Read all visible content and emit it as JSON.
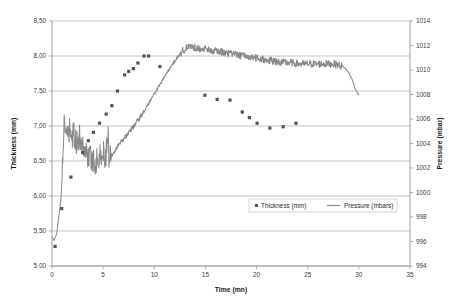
{
  "chart_data": {
    "type": "line",
    "title": "",
    "xlabel": "Time (mn)",
    "ylabel": "Thickness (mm)",
    "y2label": "Pressure (mbar)",
    "xlim": [
      0,
      35
    ],
    "ylim": [
      5.0,
      8.5
    ],
    "y2lim": [
      994,
      1014
    ],
    "grid": true,
    "legend_position": "bottom-center",
    "xticks": [
      "0",
      "5",
      "10",
      "15",
      "20",
      "25",
      "30",
      "35"
    ],
    "xtick_values": [
      0,
      5,
      10,
      15,
      20,
      25,
      30,
      35
    ],
    "yticks": [
      "5,00",
      "5,50",
      "6,00",
      "6,50",
      "7,00",
      "7,50",
      "8,00",
      "8,50"
    ],
    "ytick_values": [
      5.0,
      5.5,
      6.0,
      6.5,
      7.0,
      7.5,
      8.0,
      8.5
    ],
    "y2ticks": [
      "994",
      "996",
      "998",
      "1000",
      "1002",
      "1004",
      "1006",
      "1008",
      "1010",
      "1012",
      "1014"
    ],
    "y2tick_values": [
      994,
      996,
      998,
      1000,
      1002,
      1004,
      1006,
      1008,
      1010,
      1012,
      1014
    ],
    "series": [
      {
        "name": "Thickness (mm)",
        "axis": "left",
        "style": "scatter",
        "marker": "square",
        "color": "#555555",
        "points": [
          [
            0.3,
            5.28
          ],
          [
            0.95,
            5.82
          ],
          [
            1.85,
            6.27
          ],
          [
            3.0,
            6.62
          ],
          [
            3.55,
            6.79
          ],
          [
            4.05,
            6.91
          ],
          [
            4.65,
            7.04
          ],
          [
            5.3,
            7.17
          ],
          [
            5.85,
            7.29
          ],
          [
            6.4,
            7.5
          ],
          [
            7.1,
            7.73
          ],
          [
            7.5,
            7.78
          ],
          [
            7.95,
            7.82
          ],
          [
            8.4,
            7.9
          ],
          [
            9.0,
            8.0
          ],
          [
            9.45,
            8.0
          ],
          [
            10.55,
            7.85
          ],
          [
            14.95,
            7.44
          ],
          [
            16.15,
            7.38
          ],
          [
            17.4,
            7.37
          ],
          [
            20.05,
            7.04
          ],
          [
            21.3,
            6.97
          ],
          [
            22.6,
            6.99
          ],
          [
            23.85,
            7.04
          ],
          [
            18.6,
            7.2
          ],
          [
            19.3,
            7.12
          ]
        ]
      },
      {
        "name": "Pressure (mbars)",
        "axis": "right",
        "style": "line",
        "color": "#8a8a8a",
        "description": "Noisy rise from ~996 mbar to ~1005 mbar before 5 mn, dip to ~1002.5, steady climb to a plateau of ~1011.8 mbar near 13 mn, then a slow noisy decline to ~1010 mbar at 29 mn followed by a sharp drop to ~1008 mbar at 30 mn."
      }
    ],
    "legend": [
      {
        "label": "Thickness (mm)",
        "marker": "square",
        "color": "#555555"
      },
      {
        "label": "Pressure (mbars)",
        "marker": "line",
        "color": "#8a8a8a"
      }
    ]
  }
}
